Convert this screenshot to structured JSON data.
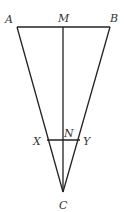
{
  "diagram": {
    "type": "geometry-triangle",
    "points": {
      "A": {
        "label": "A",
        "x": 17,
        "y": 27
      },
      "B": {
        "label": "B",
        "x": 110,
        "y": 27
      },
      "M": {
        "label": "M",
        "x": 63,
        "y": 27
      },
      "C": {
        "label": "C",
        "x": 63,
        "y": 192
      },
      "X": {
        "label": "X",
        "x": 47,
        "y": 140
      },
      "Y": {
        "label": "Y",
        "x": 80,
        "y": 140
      },
      "N": {
        "label": "N",
        "x": 63,
        "y": 140
      }
    },
    "segments": [
      {
        "from": "A",
        "to": "B"
      },
      {
        "from": "A",
        "to": "C"
      },
      {
        "from": "B",
        "to": "C"
      },
      {
        "from": "M",
        "to": "C"
      },
      {
        "from": "X",
        "to": "Y"
      }
    ],
    "labels": {
      "A": "A",
      "B": "B",
      "M": "M",
      "C": "C",
      "X": "X",
      "Y": "Y",
      "N": "N"
    },
    "colors": {
      "line": "#222222",
      "label": "#333333",
      "background": "#ffffff"
    }
  }
}
